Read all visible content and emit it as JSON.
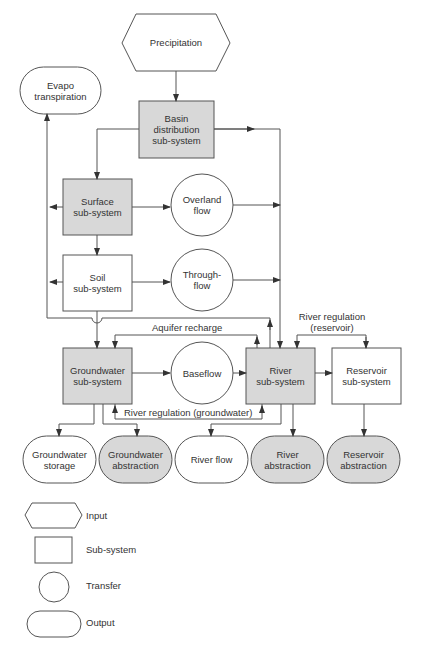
{
  "colors": {
    "subsystem_fill": "#d8d8d8",
    "output_fill": "#d8d8d8",
    "stroke": "#555555",
    "background": "#ffffff"
  },
  "nodes": {
    "precipitation": {
      "label": "Precipitation",
      "shape": "hexagon",
      "type": "input"
    },
    "evapotranspiration": {
      "label": "Evapo\ntranspiration",
      "shape": "oval",
      "type": "output"
    },
    "basin": {
      "label": "Basin\ndistribution\nsub-system",
      "shape": "box",
      "type": "sub-system",
      "shaded": true
    },
    "surface": {
      "label": "Surface\nsub-system",
      "shape": "box",
      "type": "sub-system",
      "shaded": true
    },
    "overland": {
      "label": "Overland\nflow",
      "shape": "circle",
      "type": "transfer"
    },
    "soil": {
      "label": "Soil\nsub-system",
      "shape": "box",
      "type": "sub-system",
      "shaded": false
    },
    "throughflow": {
      "label": "Through-\nflow",
      "shape": "circle",
      "type": "transfer"
    },
    "groundwater": {
      "label": "Groundwater\nsub-system",
      "shape": "box",
      "type": "sub-system",
      "shaded": true
    },
    "baseflow": {
      "label": "Baseflow",
      "shape": "circle",
      "type": "transfer"
    },
    "river": {
      "label": "River\nsub-system",
      "shape": "box",
      "type": "sub-system",
      "shaded": true
    },
    "reservoir": {
      "label": "Reservoir\nsub-system",
      "shape": "box",
      "type": "sub-system",
      "shaded": false
    },
    "gw_storage": {
      "label": "Groundwater\nstorage",
      "shape": "oval",
      "type": "output",
      "shaded": false
    },
    "gw_abstraction": {
      "label": "Groundwater\nabstraction",
      "shape": "oval",
      "type": "output",
      "shaded": true
    },
    "river_flow": {
      "label": "River flow",
      "shape": "oval",
      "type": "output",
      "shaded": false
    },
    "river_abstraction": {
      "label": "River\nabstraction",
      "shape": "oval",
      "type": "output",
      "shaded": true
    },
    "reservoir_abstraction": {
      "label": "Reservoir\nabstraction",
      "shape": "oval",
      "type": "output",
      "shaded": true
    }
  },
  "edge_labels": {
    "aquifer_recharge": "Aquifer recharge",
    "river_regulation_reservoir": "River regulation\n(reservoir)",
    "river_regulation_groundwater": "River regulation (groundwater)"
  },
  "legend": [
    {
      "shape": "hexagon",
      "label": "Input"
    },
    {
      "shape": "box",
      "label": "Sub-system"
    },
    {
      "shape": "circle",
      "label": "Transfer"
    },
    {
      "shape": "oval",
      "label": "Output"
    }
  ]
}
